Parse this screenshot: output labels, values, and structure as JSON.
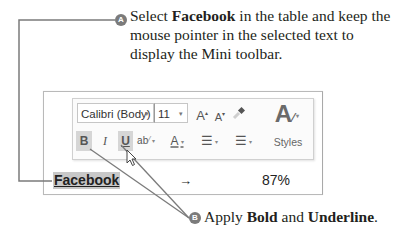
{
  "callouts": {
    "a": {
      "badge": "A",
      "prefix": "Select ",
      "bold": "Facebook",
      "suffix": " in the table and keep the mouse pointer in the selected text to display the Mini toolbar."
    },
    "b": {
      "badge": "B",
      "prefix": "Apply ",
      "bold1": "Bold",
      "middle": " and ",
      "bold2": "Underline",
      "suffix": "."
    }
  },
  "mini_toolbar": {
    "font_name": "Calibri (Body)",
    "font_size": "11",
    "dropdown_glyph": "▾",
    "grow_font": "A",
    "shrink_font": "A",
    "format_painter": "🖌",
    "styles_glyph": "A",
    "bold": "B",
    "italic": "I",
    "underline": "U",
    "highlight": "ab",
    "font_color": "A",
    "bullets": "☰",
    "numbering": "☰",
    "styles_label": "Styles",
    "active_buttons": [
      "bold",
      "underline"
    ]
  },
  "table": {
    "row": {
      "name": "Facebook",
      "trend": "→",
      "percent": "87%"
    }
  },
  "colors": {
    "callout_line": "#7b7b7b",
    "badge": "#7b7b7b",
    "selection": "#c8c8c8",
    "active_button": "#d6d6d6"
  }
}
